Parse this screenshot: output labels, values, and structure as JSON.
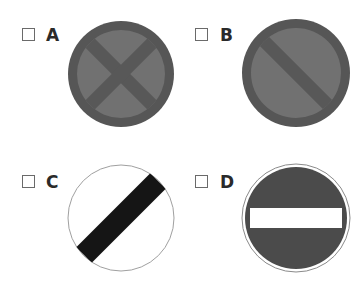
{
  "options": [
    {
      "label": "A",
      "checked": false,
      "sign": {
        "type": "no-stopping",
        "description": "Grey circle with dark border and dark X cross",
        "fill": "#6e6e6e",
        "border": "#555555",
        "cross": "#555555"
      }
    },
    {
      "label": "B",
      "checked": false,
      "sign": {
        "type": "no-waiting",
        "description": "Grey circle with dark border and single dark diagonal bar",
        "fill": "#6e6e6e",
        "border": "#555555",
        "bar": "#555555"
      }
    },
    {
      "label": "C",
      "checked": false,
      "sign": {
        "type": "national-speed-limit",
        "description": "White circle with thin grey outline and black diagonal band",
        "fill": "#ffffff",
        "border": "#9a9a9a",
        "bar": "#111111"
      }
    },
    {
      "label": "D",
      "checked": false,
      "sign": {
        "type": "no-entry",
        "description": "Dark circle with white horizontal bar and white outer ring",
        "fill": "#4a4a4a",
        "border": "#4a4a4a",
        "bar": "#ffffff"
      }
    }
  ]
}
